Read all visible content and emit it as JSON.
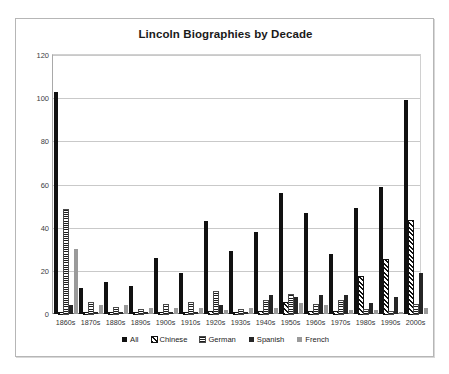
{
  "chart_data": {
    "type": "bar",
    "title": "Lincoln Biographies by Decade",
    "xlabel": "",
    "ylabel": "",
    "ylim": [
      0,
      120
    ],
    "yticks": [
      0,
      20,
      40,
      60,
      80,
      100,
      120
    ],
    "grid": true,
    "legend_position": "bottom",
    "categories": [
      "1860s",
      "1870s",
      "1880s",
      "1890s",
      "1900s",
      "1910s",
      "1920s",
      "1930s",
      "1940s",
      "1950s",
      "1960s",
      "1970s",
      "1980s",
      "1990s",
      "2000s"
    ],
    "series": [
      {
        "name": "All",
        "pattern": "solid-black",
        "color": "#111111",
        "values": [
          103,
          12,
          15,
          13,
          26,
          19,
          43,
          29,
          38,
          56,
          47,
          28,
          49,
          59,
          99
        ]
      },
      {
        "name": "Chinese",
        "pattern": "diagonal-hatch",
        "color": "#111111",
        "values": [
          0,
          0,
          0,
          0,
          0,
          0,
          1,
          0,
          1,
          5,
          1,
          1,
          17,
          25,
          43
        ]
      },
      {
        "name": "German",
        "pattern": "horizontal-stripe",
        "color": "#1d1d1d",
        "values": [
          48,
          5,
          3,
          2,
          4,
          5,
          10,
          2,
          6,
          9,
          4,
          6,
          2,
          1,
          4
        ]
      },
      {
        "name": "Spanish",
        "pattern": "solid-dark",
        "color": "#262626",
        "values": [
          4,
          1,
          1,
          1,
          1,
          1,
          4,
          1,
          9,
          8,
          9,
          9,
          5,
          8,
          19
        ]
      },
      {
        "name": "French",
        "pattern": "solid-gray",
        "color": "#9a9a9a",
        "values": [
          30,
          4,
          4,
          3,
          3,
          3,
          2,
          3,
          3,
          5,
          4,
          2,
          2,
          1,
          3
        ]
      }
    ]
  }
}
